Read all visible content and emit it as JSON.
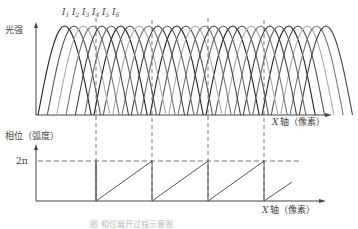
{
  "figure": {
    "top_panel": {
      "y_label": "光强",
      "x_label_var": "X",
      "x_label_text": "轴（像素）",
      "curve_labels": [
        "I1",
        "I2",
        "I3",
        "I4",
        "I5",
        "I6"
      ]
    },
    "bottom_panel": {
      "y_label": "相位（弧度）",
      "tick_2pi": "2π",
      "x_label_var": "X",
      "x_label_text": "轴（像素）"
    },
    "caption": "图 相位展开过程示意图"
  },
  "chart_data": [
    {
      "type": "line",
      "title": "",
      "ylabel": "光强",
      "xlabel": "X 轴（像素）",
      "series_labels": [
        "I1",
        "I2",
        "I3",
        "I4",
        "I5",
        "I6"
      ],
      "description": "Periodic sinusoidal intensity fringes, six phase-shifted series, spanning most of the x-axis"
    },
    {
      "type": "line",
      "title": "",
      "ylabel": "相位（弧度）",
      "xlabel": "X 轴（像素）",
      "y_ticks": [
        "2π"
      ],
      "description": "Wrapped phase sawtooth ramping 0 to 2π, resetting at the dashed fringe boundaries",
      "reset_positions_px": [
        96,
        152,
        208,
        264
      ]
    }
  ]
}
